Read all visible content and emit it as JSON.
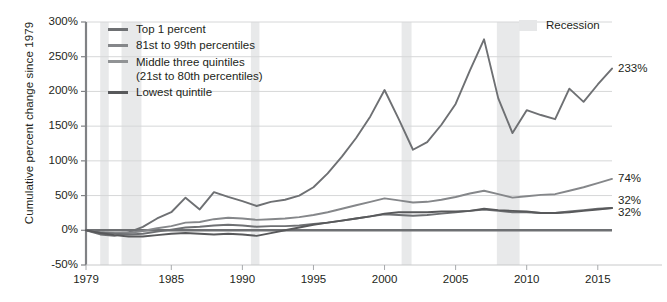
{
  "chart_data": {
    "type": "line",
    "title": "",
    "xlabel": "",
    "ylabel": "Cumulative percent change since 1979",
    "xlim": [
      1979,
      2016
    ],
    "ylim": [
      -50,
      300
    ],
    "ytick_labels": [
      "300%",
      "250%",
      "200%",
      "150%",
      "100%",
      "50%",
      "0%",
      "-50%"
    ],
    "ytick_values": [
      300,
      250,
      200,
      150,
      100,
      50,
      0,
      -50
    ],
    "xtick_labels": [
      "1979",
      "1985",
      "1990",
      "1995",
      "2000",
      "2005",
      "2010",
      "2015"
    ],
    "xtick_values": [
      1979,
      1985,
      1990,
      1995,
      2000,
      2005,
      2010,
      2015
    ],
    "grid": "horizontal",
    "legend_position": "top-left",
    "x": [
      1979,
      1980,
      1981,
      1982,
      1983,
      1984,
      1985,
      1986,
      1987,
      1988,
      1989,
      1990,
      1991,
      1992,
      1993,
      1994,
      1995,
      1996,
      1997,
      1998,
      1999,
      2000,
      2001,
      2002,
      2003,
      2004,
      2005,
      2006,
      2007,
      2008,
      2009,
      2010,
      2011,
      2012,
      2013,
      2014,
      2015,
      2016
    ],
    "series": [
      {
        "name": "Top 1 percent",
        "color": "#6e7073",
        "end_label": "233%",
        "end_value": 233,
        "values": [
          0,
          -6,
          -8,
          -3,
          5,
          17,
          26,
          47,
          30,
          55,
          48,
          42,
          35,
          41,
          44,
          50,
          62,
          82,
          106,
          133,
          164,
          202,
          160,
          116,
          127,
          152,
          182,
          230,
          275,
          190,
          140,
          173,
          166,
          160,
          204,
          185,
          210,
          233
        ]
      },
      {
        "name": "81st to 99th percentiles",
        "color": "#85878a",
        "end_label": "74%",
        "end_value": 74,
        "values": [
          0,
          -3,
          -4,
          -4,
          -1,
          3,
          6,
          11,
          12,
          16,
          18,
          17,
          15,
          16,
          17,
          19,
          22,
          26,
          31,
          36,
          41,
          46,
          43,
          40,
          41,
          44,
          48,
          53,
          57,
          52,
          47,
          49,
          51,
          52,
          57,
          62,
          68,
          74
        ]
      },
      {
        "name": "Middle three quintiles (21st to 80th percentiles)",
        "color": "#6e7073",
        "end_label": "32%",
        "end_value": 32,
        "values": [
          0,
          -3,
          -5,
          -6,
          -5,
          -2,
          1,
          4,
          5,
          7,
          8,
          7,
          5,
          6,
          6,
          7,
          9,
          11,
          14,
          17,
          20,
          23,
          22,
          21,
          22,
          24,
          26,
          28,
          30,
          28,
          26,
          26,
          25,
          25,
          27,
          29,
          31,
          32
        ]
      },
      {
        "name": "Lowest quintile",
        "color": "#58595b",
        "end_label": "32%",
        "end_value": 32,
        "values": [
          0,
          -4,
          -7,
          -9,
          -9,
          -7,
          -5,
          -4,
          -5,
          -6,
          -5,
          -6,
          -8,
          -4,
          0,
          4,
          8,
          11,
          14,
          17,
          20,
          24,
          26,
          26,
          26,
          27,
          27,
          28,
          31,
          29,
          28,
          27,
          25,
          25,
          26,
          28,
          30,
          32
        ]
      }
    ],
    "legend": [
      {
        "label": "Top 1 percent",
        "sub": "",
        "color": "#6e7073"
      },
      {
        "label": "81st to 99th percentiles",
        "sub": "",
        "color": "#85878a"
      },
      {
        "label": "Middle three quintiles",
        "sub": "(21st to 80th percentiles)",
        "color": "#919395"
      },
      {
        "label": "Lowest quintile",
        "sub": "",
        "color": "#58595b"
      }
    ],
    "recession_legend_label": "Recession",
    "recession_color": "#e8e9ea",
    "recessions": [
      {
        "start": 1980.0,
        "end": 1980.6
      },
      {
        "start": 1981.5,
        "end": 1982.9
      },
      {
        "start": 1990.6,
        "end": 1991.2
      },
      {
        "start": 2001.2,
        "end": 2001.9
      },
      {
        "start": 2007.9,
        "end": 2009.5
      }
    ],
    "grid_color": "#d6d7d8",
    "axis_color": "#808285",
    "zero_line_color": "#6e7073"
  }
}
